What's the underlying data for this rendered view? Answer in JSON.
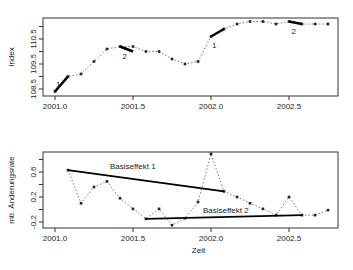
{
  "chart_data": [
    {
      "type": "line",
      "title": "",
      "xlabel": "",
      "ylabel": "Index",
      "xlim": [
        2000.92,
        2002.82
      ],
      "ylim": [
        108.3,
        111.3
      ],
      "x_ticks": [
        2001.0,
        2001.5,
        2002.0,
        2002.5
      ],
      "x_tick_labels": [
        "2001.0",
        "2001.5",
        "2002.0",
        "2002.5"
      ],
      "y_ticks": [
        108.5,
        109.0,
        109.5,
        110.0,
        110.5,
        111.0
      ],
      "y_tick_labels": [
        "108.5",
        "",
        "109.5",
        "",
        "110.5",
        ""
      ],
      "grid": false,
      "series": [
        {
          "name": "Index",
          "style": "dotted-with-points",
          "x": [
            2001.0,
            2001.083,
            2001.167,
            2001.25,
            2001.333,
            2001.417,
            2001.5,
            2001.583,
            2001.667,
            2001.75,
            2001.833,
            2001.917,
            2002.0,
            2002.083,
            2002.167,
            2002.25,
            2002.333,
            2002.417,
            2002.5,
            2002.583,
            2002.667,
            2002.75
          ],
          "values": [
            108.4,
            109.0,
            109.1,
            109.6,
            110.1,
            110.2,
            110.2,
            110.0,
            110.0,
            109.7,
            109.5,
            109.6,
            110.6,
            110.9,
            111.1,
            111.2,
            111.2,
            111.1,
            111.2,
            111.1,
            111.1,
            111.1
          ]
        }
      ],
      "highlight_segments": [
        {
          "label": "1",
          "x": [
            2001.0,
            2001.083
          ],
          "y": [
            108.4,
            109.0
          ]
        },
        {
          "label": "2",
          "x": [
            2001.417,
            2001.5
          ],
          "y": [
            110.2,
            110.0
          ]
        },
        {
          "label": "1",
          "x": [
            2002.0,
            2002.083
          ],
          "y": [
            110.6,
            110.9
          ]
        },
        {
          "label": "2",
          "x": [
            2002.5,
            2002.583
          ],
          "y": [
            111.2,
            111.1
          ]
        }
      ]
    },
    {
      "type": "line",
      "title": "",
      "xlabel": "Zeit",
      "ylabel": "mtl. Änderungsrate",
      "xlim": [
        2000.92,
        2002.82
      ],
      "ylim": [
        -0.3,
        0.92
      ],
      "x_ticks": [
        2001.0,
        2001.5,
        2002.0,
        2002.5
      ],
      "x_tick_labels": [
        "2001.0",
        "2001.5",
        "2002.0",
        "2002.5"
      ],
      "y_ticks": [
        -0.2,
        0.0,
        0.2,
        0.4,
        0.6,
        0.8
      ],
      "y_tick_labels": [
        "-0.2",
        "",
        "0.2",
        "",
        "0.6",
        ""
      ],
      "grid": false,
      "series": [
        {
          "name": "mtl. Änderungsrate",
          "style": "dotted-with-points",
          "x": [
            2001.083,
            2001.167,
            2001.25,
            2001.333,
            2001.417,
            2001.5,
            2001.583,
            2001.667,
            2001.75,
            2001.833,
            2001.917,
            2002.0,
            2002.083,
            2002.167,
            2002.25,
            2002.333,
            2002.417,
            2002.5,
            2002.583,
            2002.667,
            2002.75
          ],
          "values": [
            0.63,
            0.1,
            0.36,
            0.45,
            0.18,
            0.01,
            -0.15,
            0.01,
            -0.25,
            -0.14,
            0.12,
            0.89,
            0.29,
            0.2,
            0.1,
            0.01,
            -0.09,
            0.2,
            -0.09,
            -0.09,
            -0.01
          ]
        }
      ],
      "annotations": [
        {
          "text": "Basiseffekt 1",
          "x": [
            2001.083,
            2002.083
          ],
          "y": [
            0.63,
            0.29
          ]
        },
        {
          "text": "Basiseffekt 2",
          "x": [
            2001.583,
            2002.583
          ],
          "y": [
            -0.15,
            -0.09
          ]
        }
      ]
    }
  ],
  "labels": {
    "top_ylabel": "Index",
    "bottom_ylabel": "mtl. Änderungsrate",
    "bottom_xlabel": "Zeit",
    "basis1": "Basiseffekt 1",
    "basis2": "Basiseffekt 2",
    "seg1": "1",
    "seg2": "2"
  }
}
